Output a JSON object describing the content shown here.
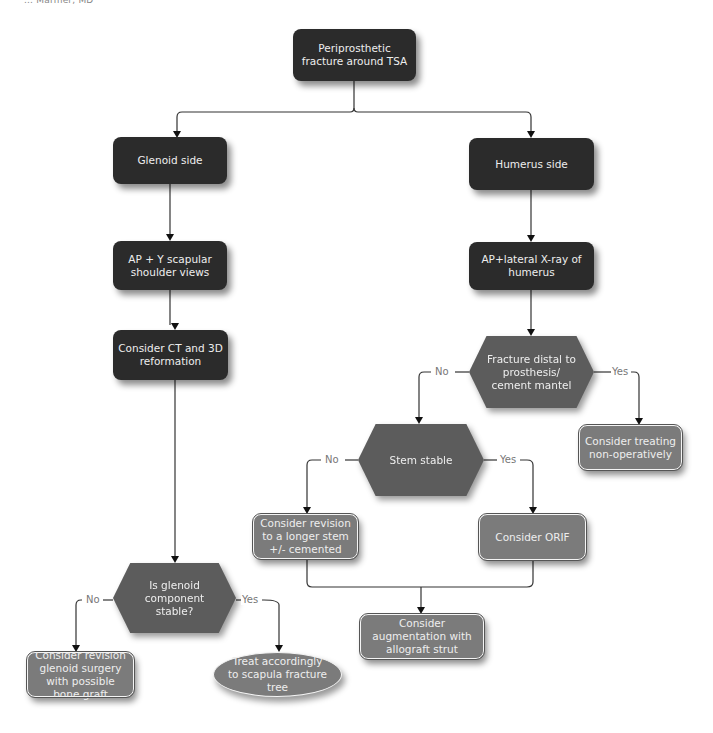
{
  "header": {
    "clipped_text": "... Marmer, MD"
  },
  "nodes": {
    "root": "Periprosthetic fracture around TSA",
    "glenoid_side": "Glenoid side",
    "humerus_side": "Humerus side",
    "ap_y_views": "AP + Y scapular shoulder views",
    "ct_3d": "Consider CT and 3D reformation",
    "ap_lateral": "AP+lateral X-ray of humerus",
    "fracture_distal": "Fracture distal to prosthesis/ cement mantel",
    "treat_nonop": "Consider treating non-operatively",
    "stem_stable": "Stem stable",
    "revision_longer_stem": "Consider revision to a longer stem +/- cemented",
    "orif": "Consider ORIF",
    "augmentation": "Consider augmentation with allograft strut",
    "glenoid_stable": "Is glenoid component stable?",
    "revision_glenoid": "Consider revision glenoid surgery with possible bone graft",
    "treat_scapula": "Treat accordingly to scapula fracture tree"
  },
  "edge_labels": {
    "fracture_no": "No",
    "fracture_yes": "Yes",
    "stem_no": "No",
    "stem_yes": "Yes",
    "glenoid_no": "No",
    "glenoid_yes": "Yes"
  },
  "colors": {
    "dark_box": "#2b2b2b",
    "hexagon": "#5c5c5c",
    "result_box": "#7b7b7b",
    "line": "#222222",
    "label": "#777777"
  }
}
